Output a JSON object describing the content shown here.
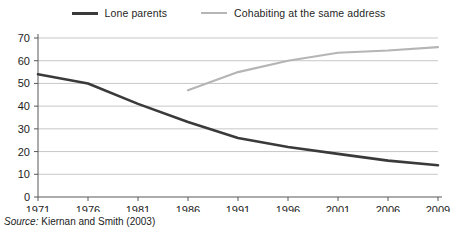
{
  "legend": {
    "entries": [
      {
        "label": "Lone parents",
        "color": "#3a3a3a",
        "icon": "line-swatch-icon"
      },
      {
        "label": "Cohabiting at the same address",
        "color": "#b5b5b5",
        "icon": "line-swatch-icon"
      }
    ]
  },
  "source": {
    "label": "Source:",
    "text": "Kiernan and Smith (2003)"
  },
  "axis": {
    "y_ticks": [
      "0",
      "10",
      "20",
      "30",
      "40",
      "50",
      "60",
      "70"
    ],
    "x_ticks": [
      "1971",
      "1976",
      "1981",
      "1986",
      "1991",
      "1996",
      "2001",
      "2006",
      "2009"
    ]
  },
  "chart_data": {
    "type": "line",
    "title": "",
    "subtitle": "",
    "xlabel": "",
    "ylabel": "",
    "xlim": [
      1971,
      2009
    ],
    "ylim": [
      0,
      70
    ],
    "ytick_step": 10,
    "grid": "horizontal",
    "legend_position": "top-center",
    "x": [
      1971,
      1976,
      1981,
      1986,
      1991,
      1996,
      2001,
      2006,
      2009
    ],
    "categories": [
      "1971",
      "1976",
      "1981",
      "1986",
      "1991",
      "1996",
      "2001",
      "2006",
      "2009"
    ],
    "series": [
      {
        "name": "Lone parents",
        "color": "#3a3a3a",
        "linewidth": 2.6,
        "x": [
          1971,
          1976,
          1981,
          1986,
          1991,
          1996,
          2001,
          2006,
          2009
        ],
        "values": [
          54,
          50,
          41,
          33,
          26,
          22,
          19,
          16,
          14
        ]
      },
      {
        "name": "Cohabiting at the same address",
        "color": "#b5b5b5",
        "linewidth": 2.2,
        "x": [
          1986,
          1991,
          1996,
          2001,
          2006,
          2009
        ],
        "values": [
          47,
          55,
          60,
          63.5,
          64.5,
          66
        ]
      }
    ]
  }
}
